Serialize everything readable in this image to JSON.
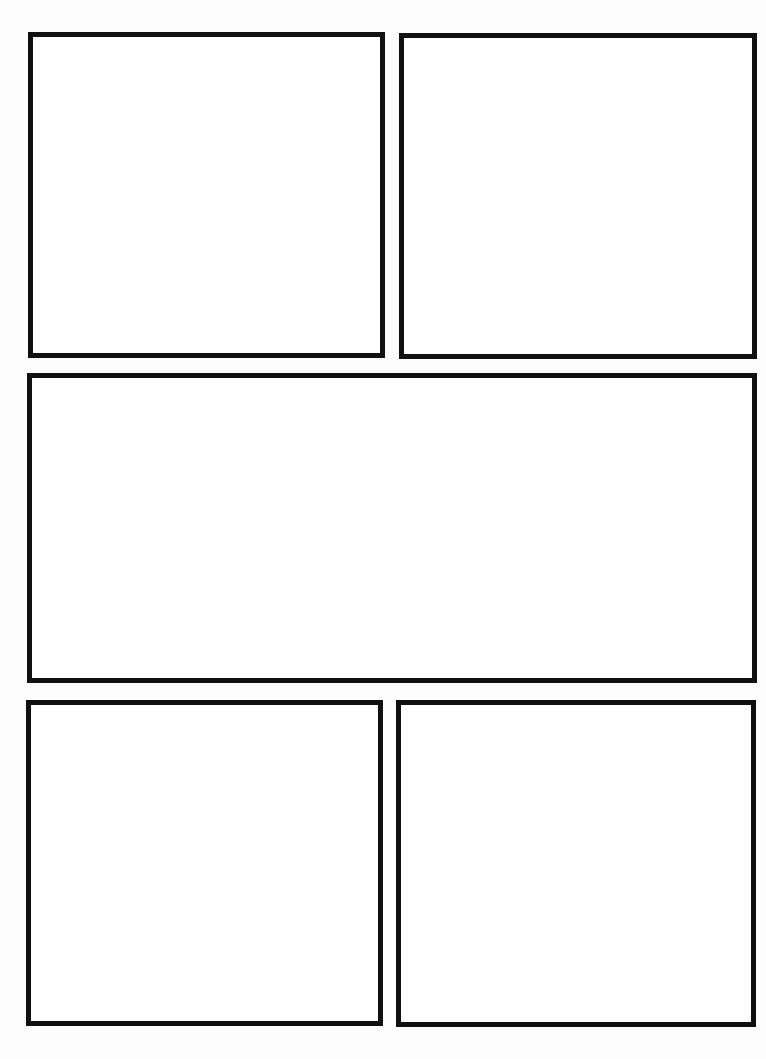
{
  "page": {
    "type": "comic-page-template",
    "background_color": "#ffffff",
    "border_color": "#111111",
    "panel_count": 5,
    "rows": [
      {
        "row": 1,
        "panels": [
          "panel-1",
          "panel-2"
        ]
      },
      {
        "row": 2,
        "panels": [
          "panel-3"
        ]
      },
      {
        "row": 3,
        "panels": [
          "panel-4",
          "panel-5"
        ]
      }
    ]
  },
  "panels": [
    {
      "id": "panel-1",
      "content": ""
    },
    {
      "id": "panel-2",
      "content": ""
    },
    {
      "id": "panel-3",
      "content": ""
    },
    {
      "id": "panel-4",
      "content": ""
    },
    {
      "id": "panel-5",
      "content": ""
    }
  ]
}
